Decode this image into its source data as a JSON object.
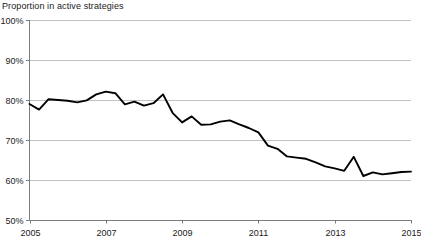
{
  "chart_data": {
    "type": "line",
    "title": "Proportion in active strategies",
    "xlabel": "",
    "ylabel": "",
    "xlim": [
      2005,
      2015
    ],
    "ylim": [
      50,
      100
    ],
    "grid": true,
    "legend": "none",
    "y_tick_labels": [
      "100%",
      "90%",
      "80%",
      "70%",
      "60%",
      "50%"
    ],
    "y_tick_values": [
      100,
      90,
      80,
      70,
      60,
      50
    ],
    "x_tick_labels": [
      "2005",
      "2007",
      "2009",
      "2011",
      "2013",
      "2015"
    ],
    "x_tick_values": [
      2005,
      2007,
      2009,
      2011,
      2013,
      2015
    ],
    "series": [
      {
        "name": "Proportion in active strategies",
        "color": "#000000",
        "x": [
          2005.0,
          2005.25,
          2005.5,
          2005.75,
          2006.0,
          2006.25,
          2006.5,
          2006.75,
          2007.0,
          2007.25,
          2007.5,
          2007.75,
          2008.0,
          2008.25,
          2008.5,
          2008.75,
          2009.0,
          2009.25,
          2009.5,
          2009.75,
          2010.0,
          2010.25,
          2010.5,
          2010.75,
          2011.0,
          2011.25,
          2011.5,
          2011.75,
          2012.0,
          2012.25,
          2012.5,
          2012.75,
          2013.0,
          2013.25,
          2013.5,
          2013.75,
          2014.0,
          2014.25,
          2014.5,
          2014.75,
          2015.0
        ],
        "values": [
          79.0,
          77.6,
          80.2,
          80.0,
          79.8,
          79.4,
          79.9,
          81.4,
          82.1,
          81.7,
          78.9,
          79.6,
          78.6,
          79.2,
          81.4,
          76.8,
          74.4,
          75.9,
          73.8,
          73.9,
          74.6,
          74.9,
          73.9,
          73.0,
          71.9,
          68.6,
          67.8,
          65.9,
          65.6,
          65.3,
          64.4,
          63.4,
          62.9,
          62.3,
          65.8,
          61.0,
          61.9,
          61.4,
          61.7,
          62.0,
          62.1
        ]
      }
    ]
  }
}
